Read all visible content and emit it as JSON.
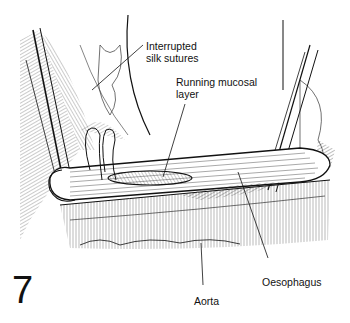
{
  "figure": {
    "number": "7",
    "labels": {
      "sutures": "Interrupted\nsilk sutures",
      "mucosal": "Running mucosal\nlayer",
      "oesophagus": "Oesophagus",
      "aorta": "Aorta"
    },
    "colors": {
      "ink": "#111111",
      "background": "#ffffff"
    }
  }
}
